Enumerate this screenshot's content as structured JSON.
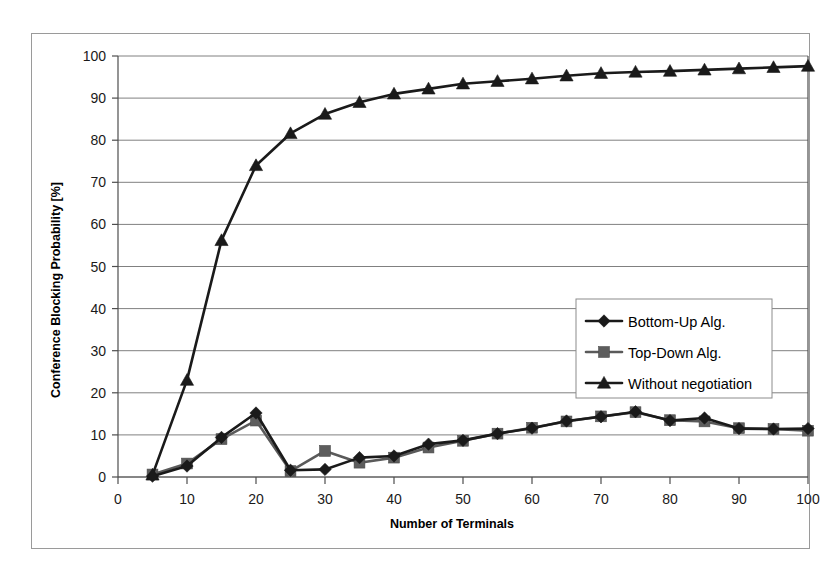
{
  "chart_data": {
    "type": "line",
    "title": "",
    "xlabel": "Number of Terminals",
    "ylabel": "Conference Blocking Probability [%]",
    "xlim": [
      0,
      100
    ],
    "ylim": [
      0,
      100
    ],
    "xticks": [
      0,
      10,
      20,
      30,
      40,
      50,
      60,
      70,
      80,
      90,
      100
    ],
    "yticks": [
      0,
      10,
      20,
      30,
      40,
      50,
      60,
      70,
      80,
      90,
      100
    ],
    "grid": "horizontal",
    "legend_position": "center-right",
    "x": [
      5,
      10,
      15,
      20,
      25,
      30,
      35,
      40,
      45,
      50,
      55,
      60,
      65,
      70,
      75,
      80,
      85,
      90,
      95,
      100
    ],
    "series": [
      {
        "name": "Bottom-Up Alg.",
        "marker": "diamond",
        "color": "#1a1a1a",
        "values": [
          0.2,
          2.6,
          9.4,
          15.2,
          1.6,
          1.8,
          4.6,
          5.0,
          7.8,
          8.7,
          10.3,
          11.6,
          13.3,
          14.3,
          15.5,
          13.4,
          14.0,
          11.5,
          11.4,
          11.5
        ]
      },
      {
        "name": "Top-Down Alg.",
        "marker": "square",
        "color": "#5d5d5d",
        "values": [
          0.6,
          3.2,
          9.0,
          13.4,
          1.4,
          6.2,
          3.4,
          4.6,
          7.0,
          8.6,
          10.3,
          11.7,
          13.2,
          14.4,
          15.4,
          13.5,
          13.2,
          11.6,
          11.4,
          11.0
        ]
      },
      {
        "name": "Without negotiation",
        "marker": "triangle",
        "color": "#1a1a1a",
        "values": [
          0.5,
          23.0,
          56.2,
          74.0,
          81.6,
          86.2,
          89.0,
          91.0,
          92.2,
          93.4,
          94.0,
          94.6,
          95.3,
          95.9,
          96.2,
          96.4,
          96.7,
          97.0,
          97.3,
          97.6
        ]
      }
    ]
  },
  "axes": {
    "y_tick_labels": [
      "0",
      "10",
      "20",
      "30",
      "40",
      "50",
      "60",
      "70",
      "80",
      "90",
      "100"
    ],
    "x_tick_labels": [
      "0",
      "10",
      "20",
      "30",
      "40",
      "50",
      "60",
      "70",
      "80",
      "90",
      "100"
    ],
    "y_axis_title": "Conference Blocking Probability [%]",
    "x_axis_title": "Number of Terminals"
  },
  "legend": {
    "entries": [
      {
        "label": "Bottom-Up Alg.",
        "marker": "diamond-marker-icon"
      },
      {
        "label": "Top-Down Alg.",
        "marker": "square-marker-icon"
      },
      {
        "label": "Without negotiation",
        "marker": "triangle-marker-icon"
      }
    ]
  },
  "colors": {
    "series_dark": "#1a1a1a",
    "series_grey": "#5d5d5d",
    "gridline": "#808080",
    "frame": "#9a9a9a",
    "background": "#ffffff"
  }
}
